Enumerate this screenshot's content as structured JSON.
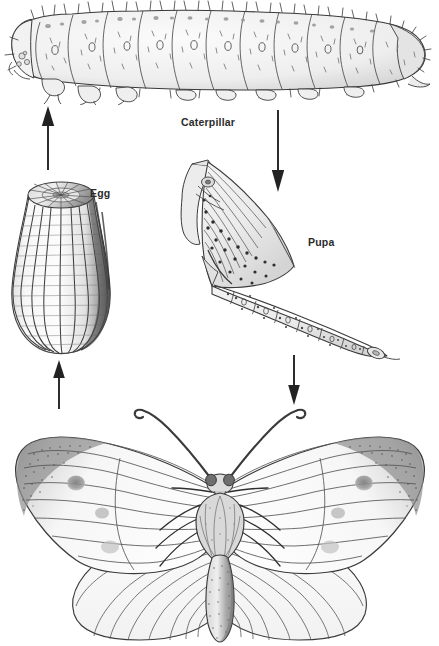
{
  "diagram": {
    "background_color": "#ffffff",
    "ink_color": "#2b2b2b",
    "labels": [
      {
        "name": "caterpillar",
        "text": "Caterpillar",
        "x": 181,
        "y": 117
      },
      {
        "name": "egg",
        "text": "Egg",
        "x": 90,
        "y": 188
      },
      {
        "name": "pupa",
        "text": "Pupa",
        "x": 308,
        "y": 237
      }
    ],
    "stages": [
      {
        "name": "caterpillar",
        "label": "Caterpillar",
        "description": "Hairy segmented larva shown in side view, head at left, spanning the full width of the top of the image",
        "segments": 12
      },
      {
        "name": "egg",
        "label": "Egg",
        "description": "Ribbed dome-shaped egg with vertical ridges, flat top, shaded dark along right side",
        "ridges": 13
      },
      {
        "name": "pupa",
        "label": "Pupa",
        "description": "Angular chrysalis tilted diagonally, pointed head upper-left, spotted segmented abdomen tapering to lower-right"
      },
      {
        "name": "butterfly",
        "label": "Butterfly",
        "description": "Cabbage white butterfly with wings spread flat, dark stippled forewing tips, round gray spots, veined wings, teardrop thorax and long stippled abdomen, two long antennae"
      }
    ],
    "arrows": [
      {
        "name": "butterfly-to-egg",
        "direction": "up",
        "x": 58,
        "y_top": 362,
        "y_bottom": 406
      },
      {
        "name": "egg-to-caterpillar",
        "direction": "up",
        "x": 47,
        "y_top": 107,
        "y_bottom": 166
      },
      {
        "name": "caterpillar-to-pupa",
        "direction": "down",
        "x": 277,
        "y_top": 112,
        "y_bottom": 190
      },
      {
        "name": "pupa-to-butterfly",
        "direction": "down",
        "x": 293,
        "y_top": 357,
        "y_bottom": 403
      }
    ]
  }
}
